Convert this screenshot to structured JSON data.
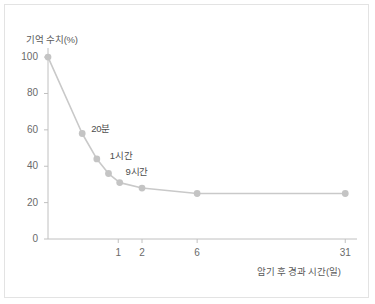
{
  "chart_data": {
    "type": "line",
    "title": "",
    "xlabel": "암기 후 경과 시간(일)",
    "ylabel": "기억 수치(%)",
    "xlim": [
      0,
      34
    ],
    "ylim": [
      0,
      105
    ],
    "grid": false,
    "legend": "none",
    "xticks": [
      {
        "value": 1,
        "label": "1"
      },
      {
        "value": 2,
        "label": "2"
      },
      {
        "value": 6,
        "label": "6"
      },
      {
        "value": 31,
        "label": "31"
      }
    ],
    "yticks": [
      {
        "value": 0,
        "label": "0"
      },
      {
        "value": 20,
        "label": "20"
      },
      {
        "value": 40,
        "label": "40"
      },
      {
        "value": 60,
        "label": "60"
      },
      {
        "value": 80,
        "label": "80"
      },
      {
        "value": 100,
        "label": "100"
      }
    ],
    "series": [
      {
        "name": "기억 수치",
        "color": "#c9c9c9",
        "marker_color": "#c4c4c4",
        "points": [
          {
            "x": 0.0,
            "y": 100,
            "label": ""
          },
          {
            "x": 0.18,
            "y": 58,
            "label": "20분"
          },
          {
            "x": 0.42,
            "y": 44,
            "label": "1시간"
          },
          {
            "x": 0.7,
            "y": 36,
            "label": "9시간"
          },
          {
            "x": 1.05,
            "y": 31,
            "label": ""
          },
          {
            "x": 2.0,
            "y": 28,
            "label": ""
          },
          {
            "x": 6.0,
            "y": 25,
            "label": ""
          },
          {
            "x": 31.0,
            "y": 25,
            "label": ""
          }
        ]
      }
    ],
    "annotations": [
      {
        "text": "20분",
        "x": 0.18,
        "y": 58
      },
      {
        "text": "1시간",
        "x": 0.42,
        "y": 44
      },
      {
        "text": "9시간",
        "x": 0.7,
        "y": 36
      }
    ],
    "colors": {
      "line": "#c9c9c9",
      "marker": "#c4c4c4",
      "axis": "#c0c0c0",
      "text": "#5a5a5a",
      "border": "#e3e3e3",
      "background": "#ffffff"
    }
  }
}
